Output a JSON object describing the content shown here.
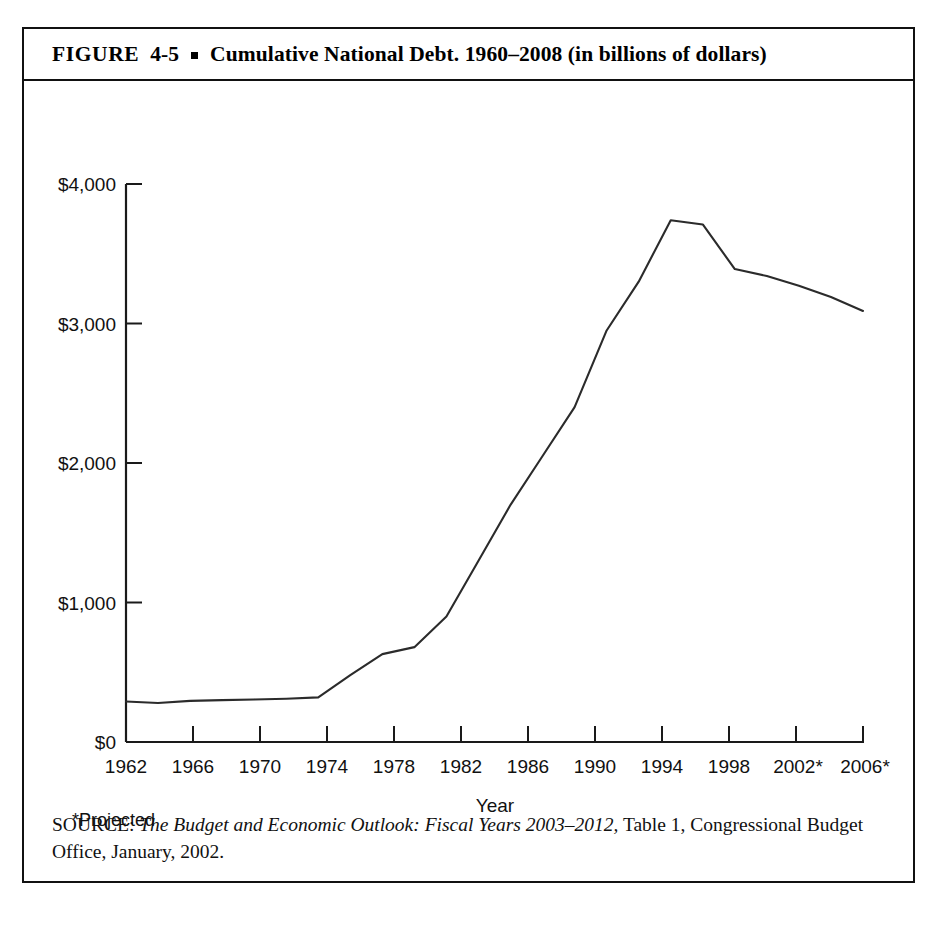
{
  "figure": {
    "label": "FIGURE",
    "number": "4-5",
    "bullet": "square-bullet",
    "title": "Cumulative National Debt. 1960–2008 (in billions of dollars)"
  },
  "footnote": "*Projected",
  "source": {
    "prefix": "SOURCE:",
    "italic_part": "The Budget and Economic Outlook: Fiscal Years 2003–2012,",
    "rest": " Table 1, Congressional Budget Office, January, 2002."
  },
  "chart_data": {
    "type": "line",
    "title": "Cumulative National Debt. 1960–2008 (in billions of dollars)",
    "xlabel": "Year",
    "ylabel": "",
    "xlim": [
      1962,
      2008
    ],
    "ylim": [
      0,
      4000
    ],
    "grid": false,
    "legend": false,
    "ytick_values": [
      0,
      1000,
      2000,
      3000,
      4000
    ],
    "ytick_labels": [
      "$0",
      "$1,000",
      "$2,000",
      "$3,000",
      "$4,000"
    ],
    "xtick_values": [
      1962,
      1966,
      1970,
      1974,
      1978,
      1982,
      1986,
      1990,
      1994,
      1998,
      2002,
      2006
    ],
    "xtick_labels": [
      "1962",
      "1966",
      "1970",
      "1974",
      "1978",
      "1982",
      "1986",
      "1990",
      "1994",
      "1998",
      "2002*",
      "2006*"
    ],
    "series": [
      {
        "name": "Cumulative National Debt",
        "color": "#2b2b2b",
        "x": [
          1962,
          1964,
          1966,
          1968,
          1970,
          1972,
          1974,
          1976,
          1978,
          1980,
          1982,
          1984,
          1986,
          1988,
          1990,
          1992,
          1994,
          1996,
          1998,
          2000,
          2002,
          2004,
          2006,
          2008
        ],
        "values": [
          290,
          280,
          295,
          300,
          305,
          310,
          320,
          480,
          630,
          680,
          900,
          1300,
          1700,
          2050,
          2400,
          2950,
          3300,
          3740,
          3710,
          3390,
          3340,
          3270,
          3190,
          3090
        ]
      }
    ]
  }
}
